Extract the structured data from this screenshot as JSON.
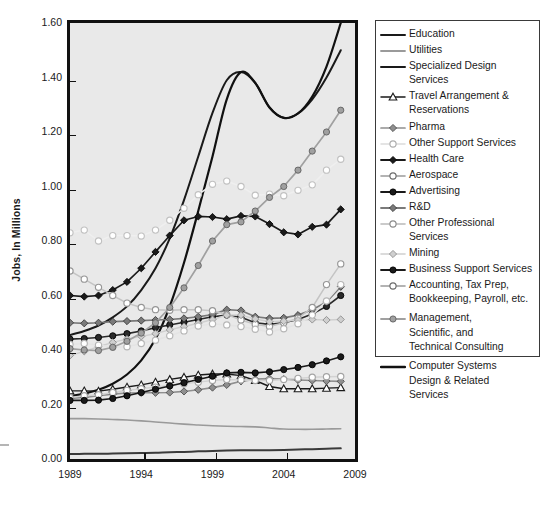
{
  "chart_data": {
    "type": "line",
    "title": "",
    "xlabel": "",
    "ylabel": "Jobs, In Millions",
    "xlim": [
      1989,
      2009
    ],
    "ylim": [
      0.0,
      1.6
    ],
    "ytick_labels": [
      "0.00",
      "0.20",
      "0.40",
      "0.60",
      "0.80",
      "1.00",
      "1.20",
      "1.40",
      "1.60"
    ],
    "ytick_values": [
      0.0,
      0.2,
      0.4,
      0.6,
      0.8,
      1.0,
      1.2,
      1.4,
      1.6
    ],
    "xtick_labels": [
      "1989",
      "1994",
      "1999",
      "2004",
      "2009"
    ],
    "xtick_values": [
      1989,
      1994,
      1999,
      2004,
      2009
    ],
    "grid": false,
    "legend_position": "right",
    "plot_background": "#e9e9e9",
    "x": [
      1989,
      1990,
      1991,
      1992,
      1993,
      1994,
      1995,
      1996,
      1997,
      1998,
      1999,
      2000,
      2001,
      2002,
      2003,
      2004,
      2005,
      2006,
      2007,
      2008
    ],
    "series": [
      {
        "name": "Education",
        "color": "#1a1a1a",
        "marker": "none",
        "width": 2.0,
        "values": [
          0.455,
          0.47,
          0.49,
          0.52,
          0.56,
          0.62,
          0.7,
          0.81,
          0.95,
          1.11,
          1.27,
          1.39,
          1.42,
          1.38,
          1.29,
          1.252,
          1.268,
          1.32,
          1.4,
          1.5
        ]
      },
      {
        "name": "Utilities",
        "color": "#9a9a9a",
        "marker": "none",
        "width": 1.6,
        "values": [
          0.148,
          0.148,
          0.147,
          0.145,
          0.143,
          0.14,
          0.136,
          0.132,
          0.128,
          0.125,
          0.122,
          0.12,
          0.119,
          0.118,
          0.114,
          0.11,
          0.109,
          0.109,
          0.11,
          0.111
        ]
      },
      {
        "name": "Specialized Design Services",
        "color": "#3a3a3a",
        "marker": "none",
        "width": 2.0,
        "values": [
          0.018,
          0.019,
          0.019,
          0.02,
          0.021,
          0.022,
          0.023,
          0.025,
          0.026,
          0.028,
          0.029,
          0.031,
          0.032,
          0.032,
          0.032,
          0.033,
          0.035,
          0.036,
          0.038,
          0.039
        ]
      },
      {
        "name": "Travel Arrangement & Reservations",
        "color": "#1a1a1a",
        "marker": "triangle-open",
        "width": 1.4,
        "values": [
          0.25,
          0.25,
          0.249,
          0.256,
          0.264,
          0.272,
          0.282,
          0.292,
          0.3,
          0.308,
          0.312,
          0.312,
          0.306,
          0.288,
          0.266,
          0.258,
          0.258,
          0.258,
          0.26,
          0.262
        ]
      },
      {
        "name": "Pharma",
        "color": "#8f8f8f",
        "marker": "diamond",
        "width": 1.6,
        "values": [
          0.222,
          0.226,
          0.232,
          0.238,
          0.242,
          0.243,
          0.243,
          0.244,
          0.248,
          0.254,
          0.262,
          0.272,
          0.285,
          0.293,
          0.295,
          0.293,
          0.29,
          0.288,
          0.286,
          0.285
        ]
      },
      {
        "name": "Other Support Services",
        "color": "#d2d2d2",
        "marker": "circle-open",
        "width": 1.4,
        "values": [
          0.226,
          0.232,
          0.236,
          0.244,
          0.252,
          0.258,
          0.264,
          0.27,
          0.276,
          0.282,
          0.288,
          0.292,
          0.29,
          0.288,
          0.288,
          0.292,
          0.296,
          0.3,
          0.302,
          0.303
        ]
      },
      {
        "name": "Health Care",
        "color": "#1a1a1a",
        "marker": "diamond",
        "width": 1.7,
        "values": [
          0.6,
          0.596,
          0.6,
          0.62,
          0.65,
          0.7,
          0.76,
          0.82,
          0.876,
          0.89,
          0.888,
          0.88,
          0.892,
          0.89,
          0.862,
          0.832,
          0.824,
          0.852,
          0.86,
          0.916
        ]
      },
      {
        "name": "Aerospace",
        "color": "#efefef",
        "marker": "circle-open",
        "width": 1.5,
        "values": [
          0.83,
          0.84,
          0.8,
          0.82,
          0.82,
          0.818,
          0.84,
          0.876,
          0.92,
          0.97,
          1.008,
          1.02,
          1.0,
          0.968,
          0.972,
          0.966,
          0.986,
          1.006,
          1.06,
          1.1
        ]
      },
      {
        "name": "Advertising",
        "color": "#2a2a2a",
        "marker": "circle-filled",
        "width": 1.6,
        "values": [
          0.44,
          0.442,
          0.446,
          0.452,
          0.46,
          0.47,
          0.482,
          0.492,
          0.502,
          0.512,
          0.522,
          0.528,
          0.52,
          0.5,
          0.494,
          0.5,
          0.512,
          0.532,
          0.56,
          0.6
        ]
      },
      {
        "name": "R&D",
        "color": "#7a7a7a",
        "marker": "diamond",
        "width": 1.7,
        "values": [
          0.5,
          0.498,
          0.5,
          0.504,
          0.506,
          0.508,
          0.51,
          0.512,
          0.516,
          0.522,
          0.53,
          0.548,
          0.545,
          0.522,
          0.516,
          0.518,
          0.528,
          0.548,
          0.576,
          0.632
        ]
      },
      {
        "name": "Other Professional Services",
        "color": "#c4c4c4",
        "marker": "circle-open",
        "width": 1.5,
        "values": [
          0.69,
          0.66,
          0.63,
          0.6,
          0.572,
          0.556,
          0.548,
          0.546,
          0.548,
          0.548,
          0.544,
          0.53,
          0.51,
          0.494,
          0.486,
          0.5,
          0.516,
          0.556,
          0.64,
          0.716
        ]
      },
      {
        "name": "Mining",
        "color": "#cfcfcf",
        "marker": "diamond",
        "width": 1.5,
        "values": [
          0.38,
          0.395,
          0.412,
          0.428,
          0.44,
          0.45,
          0.46,
          0.474,
          0.486,
          0.498,
          0.512,
          0.528,
          0.528,
          0.514,
          0.504,
          0.506,
          0.51,
          0.512,
          0.51,
          0.512
        ]
      },
      {
        "name": "Business Support Services",
        "color": "#1a1a1a",
        "marker": "circle-filled",
        "width": 1.6,
        "values": [
          0.215,
          0.215,
          0.216,
          0.222,
          0.232,
          0.244,
          0.256,
          0.268,
          0.28,
          0.292,
          0.304,
          0.316,
          0.318,
          0.316,
          0.32,
          0.328,
          0.336,
          0.346,
          0.36,
          0.375
        ]
      },
      {
        "name": "Accounting, Tax Prep, Bookkeeping, Payroll, etc.",
        "color": "#e4e4e4",
        "marker": "circle-open",
        "width": 1.5,
        "values": [
          0.42,
          0.424,
          0.418,
          0.41,
          0.412,
          0.424,
          0.436,
          0.452,
          0.47,
          0.488,
          0.496,
          0.492,
          0.486,
          0.476,
          0.466,
          0.478,
          0.496,
          0.528,
          0.58,
          0.64
        ]
      },
      {
        "name": "Management, Scientific, and Technical Consulting",
        "color": "#a0a0a0",
        "marker": "circle-filled",
        "width": 1.7,
        "values": [
          0.405,
          0.4,
          0.398,
          0.41,
          0.432,
          0.462,
          0.5,
          0.556,
          0.628,
          0.71,
          0.8,
          0.86,
          0.87,
          0.91,
          0.96,
          1.0,
          1.06,
          1.13,
          1.2,
          1.28
        ]
      },
      {
        "name": "Computer Systems Design & Related Services",
        "color": "#111111",
        "marker": "none",
        "width": 2.2,
        "values": [
          0.23,
          0.24,
          0.254,
          0.276,
          0.31,
          0.362,
          0.44,
          0.56,
          0.72,
          0.91,
          1.11,
          1.32,
          1.42,
          1.38,
          1.29,
          1.252,
          1.268,
          1.33,
          1.44,
          1.6
        ]
      }
    ]
  },
  "axis": {
    "ylabel": "Jobs, In Millions",
    "yticks": [
      "1.60",
      "1.40",
      "1.20",
      "1.00",
      "0.80",
      "0.60",
      "0.40",
      "0.20",
      "0.00"
    ],
    "xticks": [
      "1989",
      "1994",
      "1999",
      "2004",
      "2009"
    ]
  },
  "legend": {
    "entries": [
      {
        "label": "Education",
        "key": "line-solid-dark"
      },
      {
        "label": "Utilities",
        "key": "line-solid-gray"
      },
      {
        "label": "Specialized Design Services",
        "key": "line-solid-dark"
      },
      {
        "label": "Travel Arrangement &\nReservations",
        "key": "line-triangle-open"
      },
      {
        "label": "Pharma",
        "key": "line-diamond-gray"
      },
      {
        "label": "Other Support Services",
        "key": "line-circle-open-light"
      },
      {
        "label": "Health Care",
        "key": "line-diamond-dark"
      },
      {
        "label": "Aerospace",
        "key": "line-circle-open"
      },
      {
        "label": "Advertising",
        "key": "line-circle-filled-dark"
      },
      {
        "label": "R&D",
        "key": "line-diamond-mid"
      },
      {
        "label": "Other Professional Services",
        "key": "line-circle-open-mid"
      },
      {
        "label": "Mining",
        "key": "line-diamond-light"
      },
      {
        "label": "Business Support Services",
        "key": "line-circle-filled-dark"
      },
      {
        "label": "Accounting, Tax Prep,\nBookkeeping, Payroll, etc.",
        "key": "line-circle-open"
      },
      {
        "label": "Management,\nScientific, and\nTechnical Consulting",
        "key": "line-circle-filled-gray"
      },
      {
        "label": "Computer Systems\nDesign & Related\nServices",
        "key": "line-solid-black-thick"
      }
    ]
  }
}
